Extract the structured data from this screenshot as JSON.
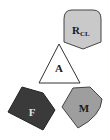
{
  "diagram": {
    "nodes": [
      {
        "id": "rcl",
        "label": "R",
        "subscript": "CL",
        "shape": "shield",
        "fill": "#c9c9c9"
      },
      {
        "id": "a",
        "label": "A",
        "shape": "triangle",
        "fill": "#ffffff"
      },
      {
        "id": "f",
        "label": "F",
        "shape": "pentagon",
        "fill": "#3a3a3a",
        "text_color": "#e0e0e0"
      },
      {
        "id": "m",
        "label": "M",
        "shape": "heptagon",
        "fill": "#9e9e9e"
      }
    ]
  }
}
